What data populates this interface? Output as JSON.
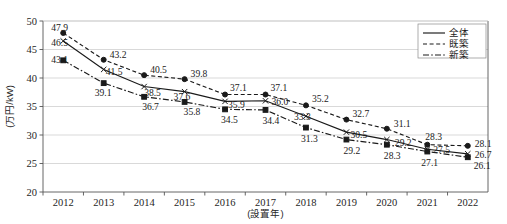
{
  "chart_data": {
    "type": "line",
    "title": "",
    "xlabel": "(設置年)",
    "ylabel": "(万円/kW)",
    "categories": [
      "2012",
      "2013",
      "2014",
      "2015",
      "2016",
      "2017",
      "2018",
      "2019",
      "2020",
      "2021",
      "2022"
    ],
    "ylim": [
      20,
      50
    ],
    "yticks": [
      "20",
      "25",
      "30",
      "35",
      "40",
      "45",
      "50"
    ],
    "grid": true,
    "legend_position": "top-right",
    "series": [
      {
        "name": "全体",
        "line_style": "solid",
        "marker": "x",
        "values": [
          46.5,
          41.5,
          38.5,
          37.6,
          35.9,
          36.0,
          33.3,
          30.5,
          29.2,
          27.5,
          26.7
        ]
      },
      {
        "name": "既築",
        "line_style": "dashed",
        "marker": "circle",
        "values": [
          47.9,
          43.2,
          40.5,
          39.8,
          37.1,
          37.1,
          35.2,
          32.7,
          31.1,
          28.3,
          28.1
        ]
      },
      {
        "name": "新築",
        "line_style": "dashdot",
        "marker": "square",
        "values": [
          43.1,
          39.1,
          36.7,
          35.8,
          34.5,
          34.4,
          31.3,
          29.2,
          28.3,
          27.1,
          26.1
        ]
      }
    ]
  },
  "legend": {
    "items": [
      {
        "label": "全体",
        "style": "solid"
      },
      {
        "label": "既築",
        "style": "dashed"
      },
      {
        "label": "新築",
        "style": "dashdot"
      }
    ]
  }
}
